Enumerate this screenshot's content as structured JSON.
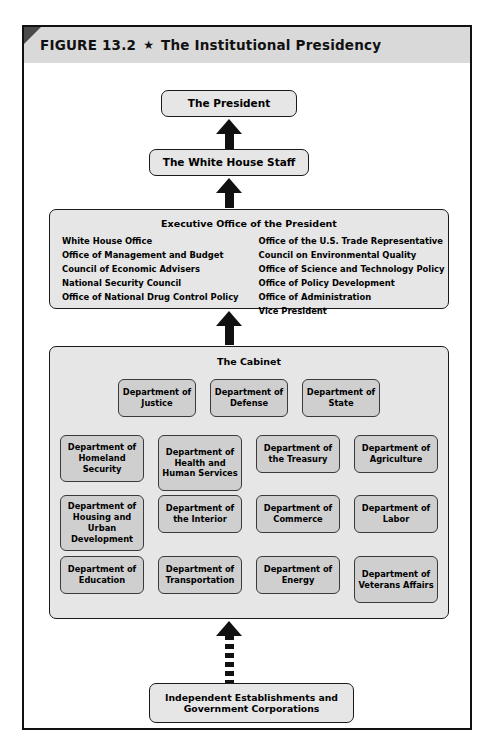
{
  "figure": {
    "label": "FIGURE 13.2",
    "star": "★",
    "title": "The Institutional Presidency"
  },
  "nodes": {
    "president": "The President",
    "white_house_staff": "The White House Staff",
    "independent": "Independent Establishments and Government Corporations"
  },
  "eop": {
    "title": "Executive Office of the President",
    "left_column": [
      "White House Office",
      "Office of Management and Budget",
      "Council of Economic Advisers",
      "National Security Council",
      "Office of National Drug Control Policy"
    ],
    "right_column": [
      "Office of the U.S. Trade Representative",
      "Council on Environmental Quality",
      "Office of Science and Technology Policy",
      "Office of Policy Development",
      "Office of Administration",
      "Vice President"
    ]
  },
  "cabinet": {
    "title": "The Cabinet",
    "rows": [
      [
        "Department of Justice",
        "Department of Defense",
        "Department of State"
      ],
      [
        "Department of Homeland Security",
        "Department of Health and Human Services",
        "Department of the Treasury",
        "Department of Agriculture"
      ],
      [
        "Department of Housing and Urban Development",
        "Department of the Interior",
        "Department of Commerce",
        "Department of Labor"
      ],
      [
        "Department of Education",
        "Department of Transportation",
        "Department of Energy",
        "Department of Veterans Affairs"
      ]
    ]
  },
  "arrows": {
    "to_president": "solid-up-arrow",
    "to_white_house_staff": "solid-up-arrow",
    "to_executive_office": "solid-up-arrow",
    "to_cabinet_from_independent": "dashed-up-arrow"
  },
  "colors": {
    "frame_border": "#111111",
    "header_band": "#d9d9d9",
    "node_fill": "#e6e6e6",
    "dept_fill": "#cfcfcf",
    "arrow": "#111111"
  }
}
